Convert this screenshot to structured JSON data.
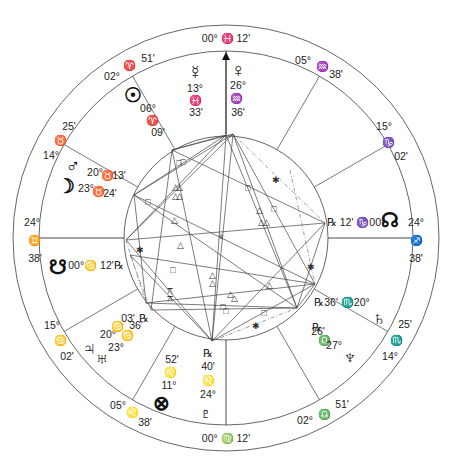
{
  "chart": {
    "center": [
      226,
      238
    ],
    "outer_radius": 213,
    "middle_radius": 187,
    "inner_radius": 102,
    "mc_arrow": {
      "x": 226,
      "y_from": 134,
      "y_to": 52
    }
  },
  "house_cusps": [
    {
      "name": "cusp-mc",
      "angle": 90,
      "type": "axis"
    },
    {
      "name": "cusp-11",
      "angle": 60
    },
    {
      "name": "cusp-12",
      "angle": 30
    },
    {
      "name": "cusp-asc-right",
      "angle": 0,
      "type": "axis"
    },
    {
      "name": "cusp-2",
      "angle": -30
    },
    {
      "name": "cusp-3",
      "angle": -60
    },
    {
      "name": "cusp-ic",
      "angle": -90,
      "type": "axis"
    },
    {
      "name": "cusp-5",
      "angle": -120
    },
    {
      "name": "cusp-6",
      "angle": -150
    },
    {
      "name": "cusp-desc-left",
      "angle": 180,
      "type": "axis"
    },
    {
      "name": "cusp-8",
      "angle": 150
    },
    {
      "name": "cusp-9",
      "angle": 120
    }
  ],
  "cusp_labels": [
    {
      "id": "mc",
      "x": 226,
      "y": 38,
      "text": "00° ♓ 12'"
    },
    {
      "id": "cusp11-deg",
      "x": 303,
      "y": 60,
      "text": "05°"
    },
    {
      "id": "cusp11-sign",
      "x": 322,
      "y": 66,
      "text": "♒"
    },
    {
      "id": "cusp11-min",
      "x": 336,
      "y": 74,
      "text": "38'"
    },
    {
      "id": "cusp12-deg",
      "x": 384,
      "y": 126,
      "text": "15°"
    },
    {
      "id": "cusp12-sign",
      "x": 388,
      "y": 142,
      "text": "♑"
    },
    {
      "id": "cusp12-min",
      "x": 401,
      "y": 156,
      "text": "02'"
    },
    {
      "id": "cusp1-deg",
      "x": 416,
      "y": 222,
      "text": "24°"
    },
    {
      "id": "cusp1-sign",
      "x": 416,
      "y": 240,
      "text": "♐"
    },
    {
      "id": "cusp1-min",
      "x": 416,
      "y": 258,
      "text": "38'"
    },
    {
      "id": "cusp2-min",
      "x": 405,
      "y": 324,
      "text": "25'"
    },
    {
      "id": "cusp2-sign",
      "x": 396,
      "y": 340,
      "text": "♏"
    },
    {
      "id": "cusp2-deg",
      "x": 390,
      "y": 356,
      "text": "14°"
    },
    {
      "id": "cusp3-min",
      "x": 342,
      "y": 404,
      "text": "51'"
    },
    {
      "id": "cusp3-sign",
      "x": 324,
      "y": 414,
      "text": "♎"
    },
    {
      "id": "cusp3-deg",
      "x": 305,
      "y": 420,
      "text": "02°"
    },
    {
      "id": "ic",
      "x": 226,
      "y": 438,
      "text": "00° ♍ 12'"
    },
    {
      "id": "cusp5-deg",
      "x": 118,
      "y": 405,
      "text": "05°"
    },
    {
      "id": "cusp5-sign",
      "x": 132,
      "y": 412,
      "text": "♌"
    },
    {
      "id": "cusp5-min",
      "x": 145,
      "y": 422,
      "text": "38'"
    },
    {
      "id": "cusp6-deg",
      "x": 52,
      "y": 325,
      "text": "15°"
    },
    {
      "id": "cusp6-sign",
      "x": 60,
      "y": 340,
      "text": "♋"
    },
    {
      "id": "cusp6-min",
      "x": 67,
      "y": 356,
      "text": "02'"
    },
    {
      "id": "cusp7-deg",
      "x": 32,
      "y": 222,
      "text": "24°"
    },
    {
      "id": "cusp7-sign",
      "x": 34,
      "y": 240,
      "text": "♊"
    },
    {
      "id": "cusp7-min",
      "x": 35,
      "y": 258,
      "text": "38'"
    },
    {
      "id": "cusp8-min",
      "x": 69,
      "y": 126,
      "text": "25'"
    },
    {
      "id": "cusp8-sign",
      "x": 60,
      "y": 140,
      "text": "♉"
    },
    {
      "id": "cusp8-deg",
      "x": 51,
      "y": 155,
      "text": "14°"
    },
    {
      "id": "cusp9-deg",
      "x": 112,
      "y": 76,
      "text": "02°"
    },
    {
      "id": "cusp9-sign",
      "x": 129,
      "y": 65,
      "text": "♈"
    },
    {
      "id": "cusp9-min",
      "x": 148,
      "y": 58,
      "text": "51'"
    }
  ],
  "planets": [
    {
      "name": "mercury",
      "glyph": "☿",
      "x": 195,
      "y": 72,
      "size": "planet"
    },
    {
      "name": "venus",
      "glyph": "♀",
      "x": 238,
      "y": 70,
      "size": "planet"
    },
    {
      "name": "sun",
      "glyph": "☉",
      "x": 133,
      "y": 95,
      "size": "planet"
    },
    {
      "name": "mars",
      "glyph": "♂",
      "x": 73,
      "y": 165,
      "size": "planet"
    },
    {
      "name": "moon",
      "glyph": "☽",
      "x": 66,
      "y": 186,
      "size": "planet"
    },
    {
      "name": "north-node",
      "glyph": "☊",
      "x": 390,
      "y": 220,
      "size": "planet"
    },
    {
      "name": "south-node",
      "glyph": "☋",
      "x": 58,
      "y": 267,
      "size": "planet"
    },
    {
      "name": "saturn",
      "glyph": "♄",
      "x": 379,
      "y": 318,
      "size": "planet"
    },
    {
      "name": "neptune",
      "glyph": "♆",
      "x": 350,
      "y": 357,
      "size": "planet"
    },
    {
      "name": "jupiter",
      "glyph": "♃",
      "x": 89,
      "y": 348,
      "size": "planet"
    },
    {
      "name": "uranus",
      "glyph": "♅",
      "x": 102,
      "y": 358,
      "size": "planet"
    },
    {
      "name": "part-of-fortune",
      "glyph": "⊗",
      "x": 161,
      "y": 403,
      "size": "planet"
    },
    {
      "name": "pluto",
      "glyph": "♇",
      "x": 206,
      "y": 413,
      "size": "planet"
    }
  ],
  "planet_labels": [
    {
      "for": "mercury",
      "x": 195,
      "y": 88,
      "text": "13°"
    },
    {
      "for": "mercury",
      "x": 195,
      "y": 100,
      "text": "♓"
    },
    {
      "for": "mercury",
      "x": 196,
      "y": 112,
      "text": "33'"
    },
    {
      "for": "venus",
      "x": 238,
      "y": 85,
      "text": "26°"
    },
    {
      "for": "venus",
      "x": 236,
      "y": 98,
      "text": "♒"
    },
    {
      "for": "venus",
      "x": 238,
      "y": 112,
      "text": "36'"
    },
    {
      "for": "sun",
      "x": 148,
      "y": 108,
      "text": "06°"
    },
    {
      "for": "sun",
      "x": 152,
      "y": 120,
      "text": "♈"
    },
    {
      "for": "sun",
      "x": 158,
      "y": 132,
      "text": "09'"
    },
    {
      "for": "mars",
      "x": 95,
      "y": 172,
      "text": "20°"
    },
    {
      "for": "mars",
      "x": 107,
      "y": 175,
      "text": "♉"
    },
    {
      "for": "mars",
      "x": 119,
      "y": 175,
      "text": "13'"
    },
    {
      "for": "moon",
      "x": 86,
      "y": 188,
      "text": "23°"
    },
    {
      "for": "moon",
      "x": 98,
      "y": 191,
      "text": "♉"
    },
    {
      "for": "moon",
      "x": 110,
      "y": 193,
      "text": "24'"
    },
    {
      "for": "north-node",
      "x": 356,
      "y": 222,
      "text": "℞ 12' ♑00°"
    },
    {
      "for": "south-node",
      "x": 96,
      "y": 265,
      "text": "00°♋ 12'℞"
    },
    {
      "for": "saturn",
      "x": 342,
      "y": 302,
      "text": "℞36' ♏20°"
    },
    {
      "for": "neptune",
      "x": 317,
      "y": 327,
      "text": "℞"
    },
    {
      "for": "neptune",
      "x": 318,
      "y": 331,
      "text": "26'"
    },
    {
      "for": "neptune",
      "x": 324,
      "y": 340,
      "text": "♎"
    },
    {
      "for": "neptune",
      "x": 334,
      "y": 345,
      "text": "27°"
    },
    {
      "for": "jupiter",
      "x": 108,
      "y": 334,
      "text": "20°"
    },
    {
      "for": "jupiter",
      "x": 117,
      "y": 326,
      "text": "♋"
    },
    {
      "for": "jupiter",
      "x": 128,
      "y": 318,
      "text": "03'"
    },
    {
      "for": "uranus",
      "x": 144,
      "y": 318,
      "text": "℞"
    },
    {
      "for": "uranus",
      "x": 136,
      "y": 325,
      "text": "36'"
    },
    {
      "for": "uranus",
      "x": 127,
      "y": 335,
      "text": "♋"
    },
    {
      "for": "uranus",
      "x": 116,
      "y": 347,
      "text": "23°"
    },
    {
      "for": "part-of-fortune",
      "x": 172,
      "y": 359,
      "text": "52'"
    },
    {
      "for": "part-of-fortune",
      "x": 170,
      "y": 372,
      "text": "♌"
    },
    {
      "for": "part-of-fortune",
      "x": 169,
      "y": 385,
      "text": "11°"
    },
    {
      "for": "pluto",
      "x": 208,
      "y": 353,
      "text": "℞"
    },
    {
      "for": "pluto",
      "x": 208,
      "y": 366,
      "text": "40'"
    },
    {
      "for": "pluto",
      "x": 208,
      "y": 380,
      "text": "♌"
    },
    {
      "for": "pluto",
      "x": 208,
      "y": 394,
      "text": "24°"
    }
  ],
  "aspect_points": {
    "top1": [
      226,
      135
    ],
    "top2": [
      233,
      134
    ],
    "nw": [
      172,
      150
    ],
    "wnw": [
      134,
      195
    ],
    "w": [
      126,
      240
    ],
    "wsw": [
      130,
      255
    ],
    "sw1": [
      146,
      303
    ],
    "sw2": [
      151,
      310
    ],
    "bottom": [
      212,
      341
    ],
    "se": [
      297,
      308
    ],
    "e_se": [
      315,
      284
    ],
    "e": [
      325,
      223
    ],
    "ne": [
      290,
      170
    ]
  },
  "aspect_lines": [
    [
      "top1",
      "wnw"
    ],
    [
      "top1",
      "w"
    ],
    [
      "top2",
      "wnw"
    ],
    [
      "top2",
      "w"
    ],
    [
      "top1",
      "nw"
    ],
    [
      "top2",
      "nw"
    ],
    [
      "top1",
      "bottom"
    ],
    [
      "top2",
      "bottom"
    ],
    [
      "top2",
      "se"
    ],
    [
      "top1",
      "se"
    ],
    [
      "top2",
      "e_se"
    ],
    [
      "nw",
      "e"
    ],
    [
      "wnw",
      "e_se"
    ],
    [
      "w",
      "e"
    ],
    [
      "wnw",
      "se"
    ],
    [
      "wsw",
      "e_se"
    ],
    [
      "w",
      "bottom"
    ],
    [
      "nw",
      "bottom"
    ],
    [
      "sw1",
      "e_se"
    ],
    [
      "sw2",
      "se"
    ],
    [
      "sw1",
      "se"
    ],
    [
      "bottom",
      "e_se"
    ],
    [
      "bottom",
      "e"
    ],
    [
      "e",
      "se"
    ],
    [
      "e_se",
      "se"
    ],
    [
      "wsw",
      "bottom"
    ],
    [
      "nw",
      "sw2"
    ],
    [
      "wnw",
      "sw1"
    ]
  ],
  "aspect_dashed": [
    [
      "top2",
      "e"
    ],
    [
      "ne",
      "e_se"
    ],
    [
      "w",
      "sw1"
    ],
    [
      "bottom",
      "se"
    ],
    [
      "wsw",
      "sw2"
    ]
  ],
  "aspect_symbols": [
    {
      "type": "square",
      "glyph": "□",
      "x": 179,
      "y": 163
    },
    {
      "type": "square",
      "glyph": "□",
      "x": 183,
      "y": 162
    },
    {
      "type": "square",
      "glyph": "□",
      "x": 148,
      "y": 202
    },
    {
      "type": "square",
      "glyph": "□",
      "x": 248,
      "y": 188
    },
    {
      "type": "square",
      "glyph": "□",
      "x": 274,
      "y": 209
    },
    {
      "type": "square",
      "glyph": "□",
      "x": 173,
      "y": 270
    },
    {
      "type": "square",
      "glyph": "□",
      "x": 223,
      "y": 307
    },
    {
      "type": "square",
      "glyph": "□",
      "x": 226,
      "y": 311
    },
    {
      "type": "square",
      "glyph": "□",
      "x": 264,
      "y": 313
    },
    {
      "type": "trine",
      "glyph": "△",
      "x": 175,
      "y": 187
    },
    {
      "type": "trine",
      "glyph": "△",
      "x": 179,
      "y": 187
    },
    {
      "type": "trine",
      "glyph": "△",
      "x": 175,
      "y": 196
    },
    {
      "type": "trine",
      "glyph": "△",
      "x": 179,
      "y": 196
    },
    {
      "type": "trine",
      "glyph": "△",
      "x": 174,
      "y": 220
    },
    {
      "type": "trine",
      "glyph": "△",
      "x": 180,
      "y": 245
    },
    {
      "type": "trine",
      "glyph": "△",
      "x": 259,
      "y": 210
    },
    {
      "type": "trine",
      "glyph": "△",
      "x": 261,
      "y": 222
    },
    {
      "type": "trine",
      "glyph": "△",
      "x": 266,
      "y": 222
    },
    {
      "type": "trine",
      "glyph": "△",
      "x": 212,
      "y": 275
    },
    {
      "type": "trine",
      "glyph": "△",
      "x": 212,
      "y": 283
    },
    {
      "type": "trine",
      "glyph": "△",
      "x": 230,
      "y": 294
    },
    {
      "type": "trine",
      "glyph": "△",
      "x": 234,
      "y": 298
    },
    {
      "type": "trine",
      "glyph": "△",
      "x": 269,
      "y": 285
    },
    {
      "type": "sextile",
      "glyph": "✱",
      "x": 276,
      "y": 180
    },
    {
      "type": "sextile",
      "glyph": "✱",
      "x": 311,
      "y": 267
    },
    {
      "type": "sextile",
      "glyph": "✱",
      "x": 256,
      "y": 326
    },
    {
      "type": "sextile",
      "glyph": "✱",
      "x": 140,
      "y": 250
    },
    {
      "type": "quincunx",
      "glyph": "⚻",
      "x": 170,
      "y": 291
    },
    {
      "type": "quincunx",
      "glyph": "⚻",
      "x": 170,
      "y": 299
    }
  ],
  "center_marker": {
    "glyph": "♆",
    "x": 221,
    "y": 237
  }
}
